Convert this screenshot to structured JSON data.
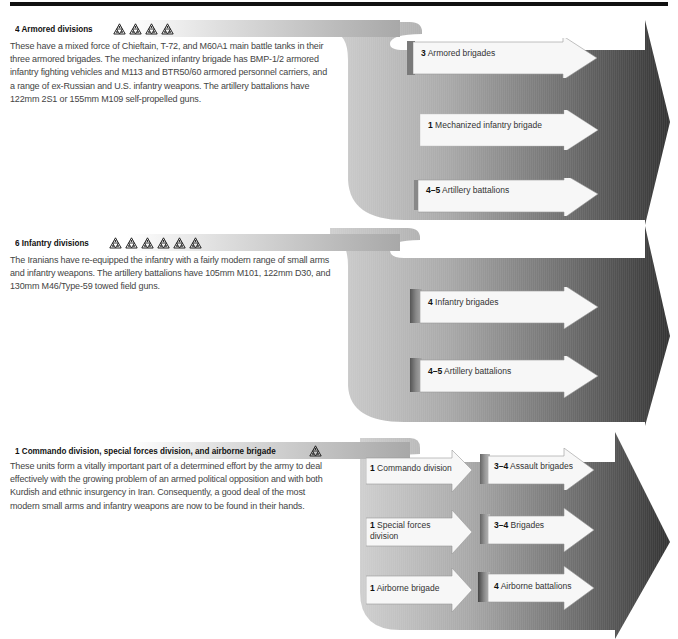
{
  "sections": [
    {
      "count": "4",
      "title": "Armored divisions",
      "icon_count": 4,
      "icon": "triangle-cluster-icon",
      "description": "These have a mixed force of Chieftain, T-72, and M60A1 main battle tanks in their\nthree armored brigades. The mechanized infantry brigade has BMP-1/2 armored\ninfantry fighting vehicles and M113 and BTR50/60 armored personnel carriers, and\na range of ex-Russian and U.S. infantry weapons. The artillery battalions have\n122mm 2S1 or 155mm M109 self-propelled guns.",
      "units": [
        {
          "count": "3",
          "label": "Armored brigades"
        },
        {
          "count": "1",
          "label": "Mechanized infantry brigade"
        },
        {
          "count": "4–5",
          "label": "Artillery battalions"
        }
      ]
    },
    {
      "count": "6",
      "title": "Infantry divisions",
      "icon_count": 6,
      "icon": "triangle-cluster-icon",
      "description": "The Iranians have re-equipped the infantry with a fairly modern range of small arms\nand infantry weapons. The artillery battalions have 105mm M101, 122mm D30, and\n130mm M46/Type-59 towed field guns.",
      "units": [
        {
          "count": "4",
          "label": "Infantry brigades"
        },
        {
          "count": "4–5",
          "label": "Artillery battalions"
        }
      ]
    },
    {
      "count": "1",
      "title": "Commando division, special forces division, and airborne brigade",
      "icon_count": 1,
      "icon": "triangle-cluster-icon",
      "description": "These units form a vitally important part of a determined effort by the army to deal\neffectively with the growing problem of an armed political opposition and with both\nKurdish and ethnic insurgency in Iran. Consequently, a good deal of the most\nmodern small arms and infantry weapons are now to be found in their hands.",
      "parents": [
        {
          "count": "1",
          "label": "Commando division"
        },
        {
          "count": "1",
          "label": "Special forces\ndivision"
        },
        {
          "count": "1",
          "label": "Airborne brigade"
        }
      ],
      "units": [
        {
          "count": "3–4",
          "label": "Assault brigades"
        },
        {
          "count": "3–4",
          "label": "Brigades"
        },
        {
          "count": "4",
          "label": "Airborne battalions"
        }
      ]
    }
  ],
  "colors": {
    "arrow_light": "#c4c4c4",
    "arrow_dark": "#3a3a3a",
    "chip_fill": "#f6f6f6",
    "chip_stack": "#8a8a8a",
    "rule": "#111111"
  }
}
